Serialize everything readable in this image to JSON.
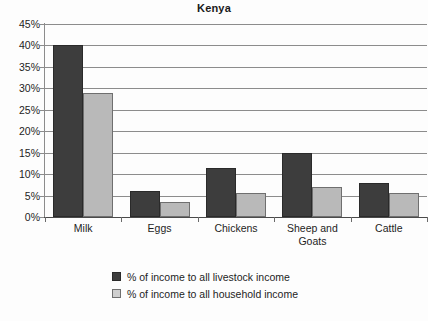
{
  "chart_data": {
    "type": "bar",
    "title": "Kenya",
    "xlabel": "",
    "ylabel": "",
    "ylim": [
      0,
      45
    ],
    "ytick_step": 5,
    "ytick_labels": [
      "45%",
      "40%",
      "35%",
      "30%",
      "25%",
      "20%",
      "15%",
      "10%",
      "5%",
      "0%"
    ],
    "ytick_values": [
      45,
      40,
      35,
      30,
      25,
      20,
      15,
      10,
      5,
      0
    ],
    "grid": true,
    "legend_position": "bottom-center",
    "categories": [
      "Milk",
      "Eggs",
      "Chickens",
      "Sheep and Goats",
      "Cattle"
    ],
    "series": [
      {
        "name": "% of income to all livestock income",
        "color": "#3d3d3d",
        "values": [
          40,
          6,
          11.5,
          15,
          8
        ]
      },
      {
        "name": "% of income to all household income",
        "color": "#b9b9b9",
        "values": [
          29,
          3.5,
          5.5,
          7,
          5.5
        ]
      }
    ]
  },
  "title": {
    "text": "Kenya"
  },
  "axis": {
    "y_labels": [
      "45%",
      "40%",
      "35%",
      "30%",
      "25%",
      "20%",
      "15%",
      "10%",
      "5%",
      "0%"
    ],
    "x_labels": [
      "Milk",
      "Eggs",
      "Chickens",
      "Sheep and Goats",
      "Cattle"
    ]
  },
  "legend": {
    "items": [
      {
        "label": "% of income to all livestock income",
        "color": "#3d3d3d"
      },
      {
        "label": "% of income to all household income",
        "color": "#b9b9b9"
      }
    ]
  }
}
